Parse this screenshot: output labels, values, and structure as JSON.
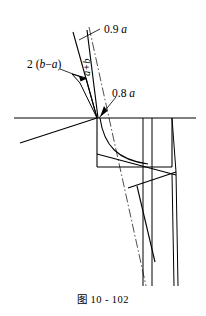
{
  "figure": {
    "caption": "图 10 - 102",
    "caption_number": "10 - 102",
    "background_color": "#ffffff",
    "line_color": "#000000",
    "labels": {
      "dim_top": "0.9 a",
      "dim_top_value": "0.9",
      "dim_top_unit": "a",
      "dim_mid": "0.8 a",
      "dim_mid_value": "0.8",
      "dim_mid_unit": "a",
      "dim_left": "2 (b−a)",
      "dim_rotated": "a+b"
    }
  }
}
